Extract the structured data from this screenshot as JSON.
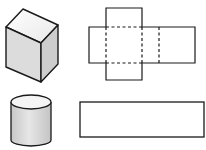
{
  "diagram": {
    "colors": {
      "stroke": "#1a1a1a",
      "top_face": "#f2f2f2",
      "front_face": "#dedede",
      "side_face": "#cfcfcf",
      "cylinder_body": "#d9d9d9",
      "cylinder_top": "#f4f4f4",
      "background": "#ffffff"
    },
    "items": [
      {
        "name": "cuboid",
        "type": "solid",
        "position": "top-left"
      },
      {
        "name": "cuboid-net",
        "type": "net",
        "position": "top-right",
        "fold_lines": "dashed"
      },
      {
        "name": "cylinder",
        "type": "solid",
        "position": "bottom-left"
      },
      {
        "name": "cylinder-lateral-rectangle",
        "type": "net",
        "position": "bottom-right"
      }
    ]
  }
}
